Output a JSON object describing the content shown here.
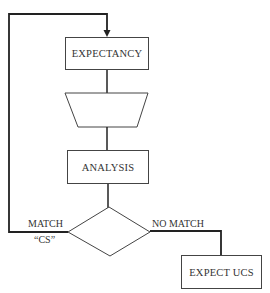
{
  "diagram": {
    "nodes": {
      "expectancy": {
        "label": "EXPECTANCY",
        "shape": "rectangle"
      },
      "filter": {
        "label": "",
        "shape": "trapezoid"
      },
      "analysis": {
        "label": "ANALYSIS",
        "shape": "rectangle"
      },
      "decision": {
        "label": "",
        "shape": "diamond"
      },
      "expect_ucs": {
        "label": "EXPECT UCS",
        "shape": "rectangle"
      }
    },
    "edge_labels": {
      "match": "MATCH",
      "cs": "“CS”",
      "no_match": "NO MATCH"
    },
    "edges": [
      {
        "from": "expectancy",
        "to": "filter"
      },
      {
        "from": "filter",
        "to": "analysis"
      },
      {
        "from": "analysis",
        "to": "decision"
      },
      {
        "from": "decision",
        "to": "expectancy",
        "label": "MATCH “CS”",
        "arrow": true
      },
      {
        "from": "decision",
        "to": "expect_ucs",
        "label": "NO MATCH"
      }
    ],
    "colors": {
      "line": "#222222",
      "box_border": "#444444",
      "text": "#333333"
    }
  }
}
